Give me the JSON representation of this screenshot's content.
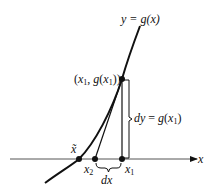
{
  "diagram": {
    "curve_label": "y = g(x)",
    "point_label": "(x1, g(x1))",
    "dy_label": "dy = g(x1)",
    "dx_label": "dx",
    "axis_label": "x",
    "points": [
      {
        "name": "x~",
        "label": "x̃"
      },
      {
        "name": "x2",
        "label": "x2"
      },
      {
        "name": "x1",
        "label": "x1"
      }
    ],
    "colors": {
      "stroke": "#111111",
      "background": "#ffffff"
    }
  }
}
